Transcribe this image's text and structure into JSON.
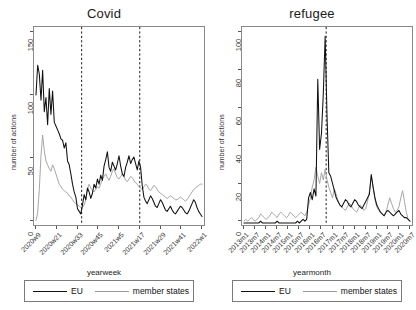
{
  "figure": {
    "panels": [
      "Covid",
      "refugee"
    ],
    "legend": {
      "eu_label": "EU",
      "ms_label": "member states"
    },
    "colors": {
      "eu": "#111111",
      "member_states": "#a6a6a6",
      "axis": "#8a8a8a",
      "vline": "#1a1a1a"
    }
  },
  "chart_data": [
    {
      "type": "line",
      "title": "Covid",
      "xlabel": "yearweek",
      "ylabel": "number of actions",
      "ylim": [
        0,
        150
      ],
      "yticks": [
        0,
        50,
        100,
        150
      ],
      "grid": false,
      "legend_position": "bottom",
      "annotations": [
        {
          "type": "vline",
          "x": "2020w31",
          "style": "dashed"
        },
        {
          "type": "vline",
          "x": "2021w17",
          "style": "dashed"
        }
      ],
      "xtick_labels": [
        "2020w9",
        "2020w21",
        "2020w33",
        "2020w45",
        "2021w5",
        "2021w17",
        "2021w29",
        "2021w41",
        "2022w1"
      ],
      "x": [
        0,
        1,
        2,
        3,
        4,
        5,
        6,
        7,
        8,
        9,
        10,
        11,
        12,
        13,
        14,
        15,
        16,
        17,
        18,
        19,
        20,
        21,
        22,
        23,
        24,
        25,
        26,
        27,
        28,
        29,
        30,
        31,
        32,
        33,
        34,
        35,
        36,
        37,
        38,
        39,
        40,
        41,
        42,
        43,
        44,
        45,
        46,
        47,
        48,
        49,
        50,
        51,
        52,
        53,
        54,
        55,
        56,
        57,
        58,
        59,
        60,
        61,
        62,
        63,
        64,
        65,
        66,
        67,
        68,
        69,
        70,
        71,
        72,
        73,
        74,
        75,
        76,
        77,
        78,
        79,
        80,
        81,
        82,
        83,
        84,
        85,
        86,
        87,
        88,
        89,
        90,
        91,
        92,
        93,
        94,
        95,
        96,
        97,
        98,
        99,
        100
      ],
      "series": [
        {
          "name": "EU",
          "values": [
            99,
            122,
            115,
            95,
            118,
            86,
            97,
            76,
            104,
            84,
            102,
            78,
            75,
            72,
            69,
            65,
            64,
            58,
            62,
            48,
            45,
            38,
            30,
            24,
            20,
            11,
            9,
            7,
            14,
            22,
            18,
            27,
            24,
            19,
            23,
            30,
            27,
            34,
            30,
            37,
            33,
            44,
            49,
            55,
            43,
            40,
            47,
            44,
            41,
            46,
            52,
            44,
            38,
            36,
            43,
            47,
            52,
            46,
            49,
            51,
            46,
            41,
            48,
            43,
            29,
            20,
            17,
            15,
            18,
            21,
            19,
            16,
            13,
            12,
            15,
            18,
            16,
            13,
            10,
            9,
            11,
            13,
            10,
            8,
            7,
            9,
            11,
            13,
            12,
            10,
            8,
            7,
            9,
            12,
            15,
            18,
            16,
            12,
            9,
            7,
            5
          ]
        },
        {
          "name": "member states",
          "values": [
            2,
            8,
            26,
            52,
            68,
            56,
            48,
            45,
            42,
            40,
            45,
            42,
            38,
            34,
            30,
            28,
            26,
            25,
            24,
            23,
            21,
            20,
            18,
            16,
            15,
            14,
            13,
            12,
            12,
            14,
            18,
            26,
            30,
            27,
            25,
            24,
            26,
            28,
            27,
            30,
            34,
            36,
            38,
            35,
            33,
            36,
            40,
            42,
            38,
            35,
            34,
            36,
            38,
            36,
            33,
            32,
            34,
            36,
            35,
            33,
            31,
            30,
            28,
            27,
            26,
            28,
            30,
            29,
            26,
            25,
            27,
            29,
            28,
            26,
            24,
            23,
            22,
            21,
            20,
            19,
            20,
            21,
            20,
            19,
            18,
            18,
            19,
            20,
            19,
            18,
            17,
            18,
            20,
            22,
            24,
            26,
            27,
            28,
            29,
            30,
            30
          ]
        }
      ]
    },
    {
      "type": "line",
      "title": "refugee",
      "xlabel": "yearmonth",
      "ylabel": "number of actions",
      "ylim": [
        0,
        108
      ],
      "yticks": [
        0,
        20,
        40,
        60,
        80,
        100
      ],
      "grid": false,
      "legend_position": "bottom",
      "annotations": [
        {
          "type": "vline",
          "x": "2016m4",
          "style": "dashed"
        }
      ],
      "xtick_labels": [
        "2013m1",
        "2013m7",
        "2014m1",
        "2014m7",
        "2015m1",
        "2015m7",
        "2016m1",
        "2016m7",
        "2017m1",
        "2017m7",
        "2018m1",
        "2018m7",
        "2019m1",
        "2019m7",
        "2020m1",
        "2020m7"
      ],
      "x": [
        0,
        1,
        2,
        3,
        4,
        5,
        6,
        7,
        8,
        9,
        10,
        11,
        12,
        13,
        14,
        15,
        16,
        17,
        18,
        19,
        20,
        21,
        22,
        23,
        24,
        25,
        26,
        27,
        28,
        29,
        30,
        31,
        32,
        33,
        34,
        35,
        36,
        37,
        38,
        39,
        40,
        41,
        42,
        43,
        44,
        45,
        46,
        47,
        48,
        49,
        50,
        51,
        52,
        53,
        54,
        55,
        56,
        57,
        58,
        59,
        60,
        61,
        62,
        63,
        64,
        65,
        66,
        67,
        68,
        69,
        70,
        71,
        72,
        73,
        74,
        75,
        76,
        77,
        78,
        79,
        80,
        81,
        82,
        83,
        84,
        85,
        86,
        87,
        88,
        89,
        90
      ],
      "series": [
        {
          "name": "EU",
          "values": [
            0,
            0,
            0,
            0,
            0,
            0,
            0,
            0,
            0,
            1,
            0,
            0,
            0,
            0,
            0,
            0,
            0,
            0,
            1,
            0,
            0,
            0,
            0,
            0,
            0,
            0,
            0,
            0,
            0,
            1,
            0,
            1,
            2,
            1,
            2,
            14,
            17,
            13,
            19,
            15,
            80,
            41,
            50,
            72,
            104,
            60,
            28,
            26,
            22,
            18,
            14,
            12,
            10,
            9,
            11,
            13,
            12,
            10,
            9,
            11,
            13,
            12,
            10,
            9,
            8,
            10,
            12,
            14,
            16,
            27,
            20,
            14,
            10,
            8,
            6,
            5,
            4,
            6,
            7,
            6,
            5,
            4,
            5,
            6,
            7,
            5,
            4,
            3,
            3,
            2,
            1
          ]
        },
        {
          "name": "member states",
          "values": [
            1,
            2,
            1,
            2,
            3,
            2,
            1,
            2,
            3,
            5,
            4,
            3,
            2,
            3,
            4,
            6,
            5,
            4,
            3,
            5,
            6,
            5,
            4,
            3,
            4,
            6,
            5,
            4,
            3,
            4,
            5,
            6,
            5,
            4,
            6,
            10,
            14,
            20,
            24,
            31,
            26,
            22,
            28,
            24,
            30,
            24,
            20,
            17,
            14,
            19,
            16,
            12,
            10,
            9,
            8,
            7,
            9,
            11,
            10,
            8,
            7,
            6,
            8,
            10,
            9,
            7,
            8,
            12,
            18,
            26,
            20,
            13,
            9,
            7,
            6,
            5,
            4,
            6,
            10,
            14,
            11,
            8,
            6,
            7,
            9,
            14,
            18,
            12,
            6,
            2,
            1
          ]
        }
      ]
    }
  ]
}
